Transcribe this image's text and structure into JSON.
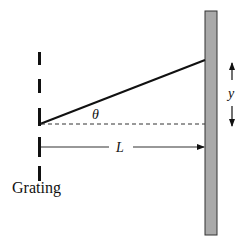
{
  "diagram": {
    "labels": {
      "grating": "Grating",
      "angle": "θ",
      "distance": "L",
      "displacement": "y"
    },
    "colors": {
      "ink": "#111111",
      "screen_fill": "#a9a9a9",
      "screen_border": "#333333",
      "background": "#ffffff"
    },
    "elements": {
      "grating": {
        "x": 39.5,
        "slits_y": [
          [
            52,
            65
          ],
          [
            79,
            93
          ],
          [
            106,
            126
          ],
          [
            133,
            158
          ],
          [
            163,
            181
          ]
        ]
      },
      "screen": {
        "x": 205,
        "y": 11,
        "width": 12,
        "height": 224
      },
      "ray": {
        "from": [
          40,
          124
        ],
        "to": [
          205,
          60
        ]
      },
      "axis_dashed": {
        "from": [
          40,
          124
        ],
        "to": [
          205,
          124
        ]
      },
      "distance_arrow": {
        "from": [
          41,
          147
        ],
        "to": [
          205,
          147
        ],
        "label_x": 121
      },
      "displacement_arrow": {
        "x": 232,
        "top": 62,
        "bottom": 127,
        "label_y": 97
      }
    }
  }
}
